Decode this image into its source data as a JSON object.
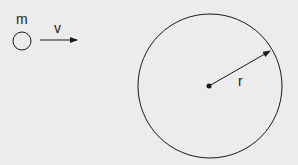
{
  "diagram": {
    "particle": {
      "label": "m",
      "cx": 22,
      "cy": 41,
      "r": 9
    },
    "velocity": {
      "label": "v",
      "x1": 40,
      "y1": 40,
      "x2": 77,
      "y2": 40
    },
    "region": {
      "cx": 210,
      "cy": 86,
      "r": 72
    },
    "radius": {
      "label": "r",
      "x1": 209,
      "y1": 86,
      "x2": 270,
      "y2": 51
    },
    "colors": {
      "background": "#ececec",
      "stroke": "#1a1a1a"
    }
  }
}
